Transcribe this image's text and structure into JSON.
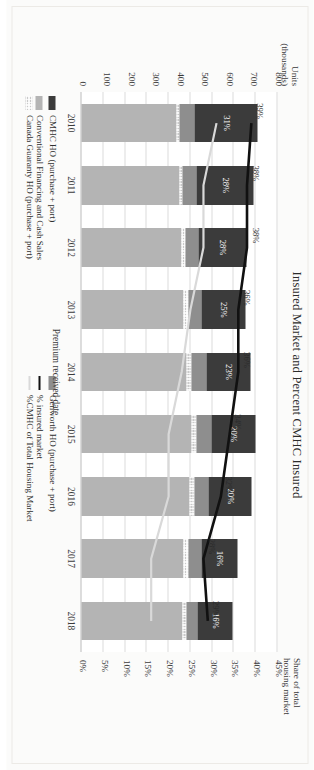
{
  "chart_title": "Insured Market and Percent CMHC Insured",
  "axes": {
    "x_title": "Premium received date",
    "y_left_title_line1": "Units",
    "y_left_title_line2": "(thousands)",
    "y_right_title_line1": "Share of total",
    "y_right_title_line2": "housing market",
    "y_left_ticks": [
      "800",
      "700",
      "600",
      "500",
      "400",
      "300",
      "200",
      "100",
      "0"
    ],
    "y_right_ticks": [
      "45%",
      "40%",
      "35%",
      "30%",
      "25%",
      "20%",
      "15%",
      "10%",
      "5%",
      "0%"
    ]
  },
  "legend": [
    {
      "label": "CMHC HO (purchase + port)",
      "swatch": "solid",
      "color": "#3b3b3b"
    },
    {
      "label": "Canada Guaranty HO (purchase + port)",
      "swatch": "hatched",
      "color": "#c9c9c9"
    },
    {
      "label": "Conventional Financing and Cash Sales",
      "swatch": "solid",
      "color": "#b4b4b4"
    },
    {
      "label": "%CMHC of Total Housing Market",
      "swatch": "line-light",
      "color": "#d9d9d9"
    },
    {
      "label": "Genworth HO (purchase + port)",
      "swatch": "solid",
      "color": "#8e8e8e"
    },
    {
      "label": "% insured market",
      "swatch": "line-dark",
      "color": "#111111"
    }
  ],
  "chart_data": {
    "type": "bar",
    "title": "Insured Market and Percent CMHC Insured",
    "xlabel": "Premium received date",
    "ylabel": "Units (thousands)",
    "ylabel_secondary": "Share of total housing market",
    "ylim": [
      0,
      800
    ],
    "ylim_secondary": [
      0,
      0.45
    ],
    "grid": true,
    "legend_position": "bottom",
    "categories": [
      "2010",
      "2011",
      "2012",
      "2013",
      "2014",
      "2015",
      "2016",
      "2017",
      "2018"
    ],
    "series": [
      {
        "name": "CMHC HO (purchase + port)",
        "color": "#3b3b3b",
        "values": [
          260,
          235,
          195,
          180,
          180,
          180,
          175,
          150,
          140
        ]
      },
      {
        "name": "Genworth HO (purchase + port)",
        "color": "#8e8e8e",
        "values": [
          60,
          55,
          52,
          55,
          60,
          62,
          58,
          50,
          45
        ]
      },
      {
        "name": "Canada Guaranty HO (purchase + port)",
        "color": "#c9c9c9",
        "values": [
          12,
          14,
          16,
          18,
          20,
          22,
          22,
          20,
          18
        ]
      },
      {
        "name": "Conventional Financing and Cash Sales",
        "color": "#b4b4b4",
        "values": [
          388,
          400,
          410,
          418,
          430,
          448,
          440,
          418,
          412
        ]
      }
    ],
    "lines": [
      {
        "name": "% insured market",
        "color": "#111111",
        "axis": "secondary",
        "values": [
          0.39,
          0.38,
          0.38,
          0.36,
          0.36,
          0.34,
          0.32,
          0.28,
          0.29
        ],
        "labels": [
          "39%",
          "38%",
          "38%",
          "36%",
          "36%",
          "34%",
          "32%",
          "28%",
          "29%"
        ]
      },
      {
        "name": "%CMHC of Total Housing Market",
        "color": "#d9d9d9",
        "axis": "secondary",
        "values": [
          0.31,
          0.28,
          0.28,
          0.25,
          0.23,
          0.2,
          0.2,
          0.16,
          0.16
        ],
        "labels": [
          "31%",
          "28%",
          "28%",
          "25%",
          "23%",
          "20%",
          "20%",
          "16%",
          "16%"
        ]
      }
    ],
    "bar_labels": [
      "31%",
      "28%",
      "28%",
      "25%",
      "23%",
      "20%",
      "20%",
      "16%",
      "16%"
    ]
  }
}
